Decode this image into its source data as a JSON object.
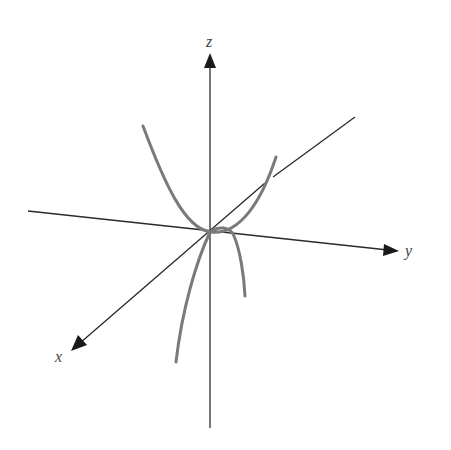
{
  "figure": {
    "axes": {
      "x": {
        "label": "x"
      },
      "y": {
        "label": "y"
      },
      "z": {
        "label": "z"
      }
    },
    "colors": {
      "axis": "#2a2a2a",
      "curve": "#7a7a7a",
      "label": "#444444",
      "background": "#ffffff"
    }
  }
}
